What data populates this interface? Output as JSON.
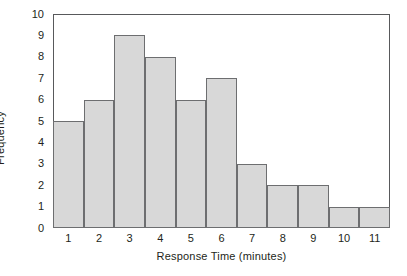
{
  "chart_data": {
    "type": "bar",
    "title": "",
    "subtitle": "",
    "xlabel": "Response Time (minutes)",
    "ylabel": "Frequency",
    "categories": [
      "1",
      "2",
      "3",
      "4",
      "5",
      "6",
      "7",
      "8",
      "9",
      "10",
      "11"
    ],
    "values": [
      5,
      6,
      9,
      8,
      6,
      7,
      3,
      2,
      2,
      1,
      1
    ],
    "ylim": [
      0,
      10
    ],
    "yticks": [
      "10",
      "9",
      "8",
      "7",
      "6",
      "5",
      "4",
      "3",
      "2",
      "1",
      "0"
    ],
    "xticks": [
      "1",
      "2",
      "3",
      "4",
      "5",
      "6",
      "7",
      "8",
      "9",
      "10",
      "11"
    ],
    "grid": false,
    "legend": null,
    "legend_position": "none",
    "annotations": [],
    "series": [
      {
        "name": "Frequency",
        "values": [
          5,
          6,
          9,
          8,
          6,
          7,
          3,
          2,
          2,
          1,
          1
        ]
      }
    ]
  },
  "style": {
    "bar_fill": "#d8d8d8",
    "bar_border": "#6d6e70",
    "axis_color": "#58595b",
    "text_color": "#231f20",
    "background": "#ffffff"
  }
}
